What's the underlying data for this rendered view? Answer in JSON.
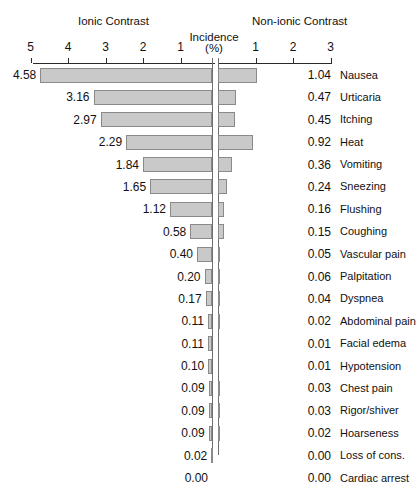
{
  "chart_data": {
    "type": "bar",
    "subtype": "diverging-horizontal-butterfly",
    "title": "",
    "xlabel": "Incidence (%)",
    "ylabel": "",
    "headers": {
      "left": "Ionic Contrast",
      "center_line1": "Incidence",
      "center_line2": "(%)",
      "right": "Non-ionic Contrast"
    },
    "axis": {
      "left_ticks": [
        5,
        4,
        3,
        2,
        1
      ],
      "left_tick_labels": [
        "5",
        "4",
        "3",
        "2",
        "1"
      ],
      "right_ticks": [
        1,
        2,
        3
      ],
      "right_tick_labels": [
        "1",
        "2",
        "3"
      ],
      "left_range": [
        5,
        0
      ],
      "right_range": [
        0,
        3
      ],
      "units_per_pixel": 0.02667,
      "grid": false,
      "legend": "none"
    },
    "categories": [
      "Nausea",
      "Urticaria",
      "Itching",
      "Heat",
      "Vomiting",
      "Sneezing",
      "Flushing",
      "Coughing",
      "Vascular pain",
      "Palpitation",
      "Dyspnea",
      "Abdominal pain",
      "Facial edema",
      "Hypotension",
      "Chest pain",
      "Rigor/shiver",
      "Hoarseness",
      "Loss of cons.",
      "Cardiac arrest"
    ],
    "series": [
      {
        "name": "Ionic Contrast",
        "values": [
          4.58,
          3.16,
          2.97,
          2.29,
          1.84,
          1.65,
          1.12,
          0.58,
          0.4,
          0.2,
          0.17,
          0.11,
          0.11,
          0.1,
          0.09,
          0.09,
          0.09,
          0.02,
          0.0
        ],
        "labels": [
          "4.58",
          "3.16",
          "2.97",
          "2.29",
          "1.84",
          "1.65",
          "1.12",
          "0.58",
          "0.40",
          "0.20",
          "0.17",
          "0.11",
          "0.11",
          "0.10",
          "0.09",
          "0.09",
          "0.09",
          "0.02",
          "0.00"
        ]
      },
      {
        "name": "Non-ionic Contrast",
        "values": [
          1.04,
          0.47,
          0.45,
          0.92,
          0.36,
          0.24,
          0.16,
          0.15,
          0.05,
          0.06,
          0.04,
          0.02,
          0.01,
          0.01,
          0.03,
          0.03,
          0.02,
          0.0,
          0.0
        ],
        "labels": [
          "1.04",
          "0.47",
          "0.45",
          "0.92",
          "0.36",
          "0.24",
          "0.16",
          "0.15",
          "0.05",
          "0.06",
          "0.04",
          "0.02",
          "0.01",
          "0.01",
          "0.03",
          "0.03",
          "0.02",
          "0.00",
          "0.00"
        ]
      }
    ],
    "colors": {
      "bar_fill": "#c9c9c9",
      "bar_stroke": "#8a8a8a",
      "axis": "#2b2b2b",
      "text": "#111111",
      "background": "#ffffff"
    }
  }
}
